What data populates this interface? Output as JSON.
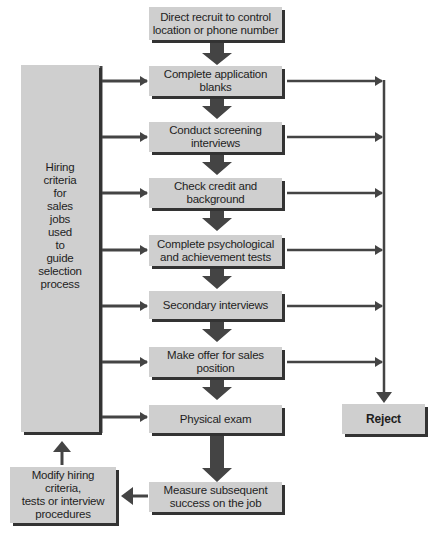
{
  "diagram": {
    "steps": [
      {
        "id": "direct",
        "label": "Direct recruit to control\nlocation or phone number"
      },
      {
        "id": "application",
        "label": "Complete application\nblanks"
      },
      {
        "id": "screening",
        "label": "Conduct screening\ninterviews"
      },
      {
        "id": "credit",
        "label": "Check credit and\nbackground"
      },
      {
        "id": "tests",
        "label": "Complete psychological\nand achievement tests"
      },
      {
        "id": "secondary",
        "label": "Secondary interviews"
      },
      {
        "id": "offer",
        "label": "Make offer for sales\nposition"
      },
      {
        "id": "physical",
        "label": "Physical exam"
      },
      {
        "id": "measure",
        "label": "Measure subsequent\nsuccess on the job"
      }
    ],
    "criteria": {
      "label": "Hiring\ncriteria\nfor\nsales\njobs\nused\nto\nguide\nselection\nprocess"
    },
    "modify": {
      "label": "Modify hiring\ncriteria,\ntests or interview\nprocedures"
    },
    "reject": {
      "label": "Reject"
    },
    "colors": {
      "box_fill": "#cfcfcf",
      "arrow": "#444444",
      "shadow": "#333333",
      "text": "#1e1e1e"
    }
  }
}
